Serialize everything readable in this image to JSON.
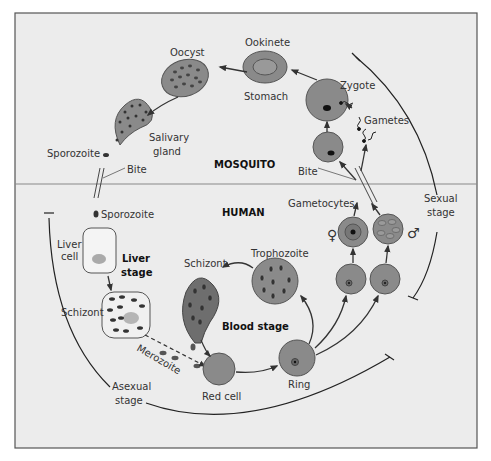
{
  "colors": {
    "background": "#ececec",
    "frame": "#555555",
    "cell_fill": "#8a8a8a",
    "cell_dark": "#6e6e6e",
    "cell_light": "#b5b5b5",
    "nucleus": "#111111",
    "line": "#222222"
  },
  "regions": {
    "mosquito": "MOSQUITO",
    "human": "HUMAN"
  },
  "stages": {
    "liver_stage": [
      "Liver",
      "stage"
    ],
    "blood_stage": "Blood stage",
    "sexual_stage": [
      "Sexual",
      "stage"
    ],
    "asexual_stage": [
      "Asexual",
      "stage"
    ]
  },
  "labels": {
    "oocyst": "Oocyst",
    "ookinete": "Ookinete",
    "stomach": "Stomach",
    "zygote": "Zygote",
    "gametes": "Gametes",
    "salivary_gland": [
      "Salivary",
      "gland"
    ],
    "sporozoite_mosquito": "Sporozoite",
    "bite_left": "Bite",
    "bite_right": "Bite",
    "sporozoite_human": "Sporozoite",
    "liver_cell": [
      "Liver",
      "cell"
    ],
    "schizont_liver": "Schizont",
    "merozoite": "Merozoite",
    "red_cell": "Red cell",
    "ring": "Ring",
    "trophozoite": "Trophozoite",
    "schizont_blood": "Schizont",
    "gametocytes": "Gametocytes",
    "female_symbol": "♀",
    "male_symbol": "♂"
  }
}
